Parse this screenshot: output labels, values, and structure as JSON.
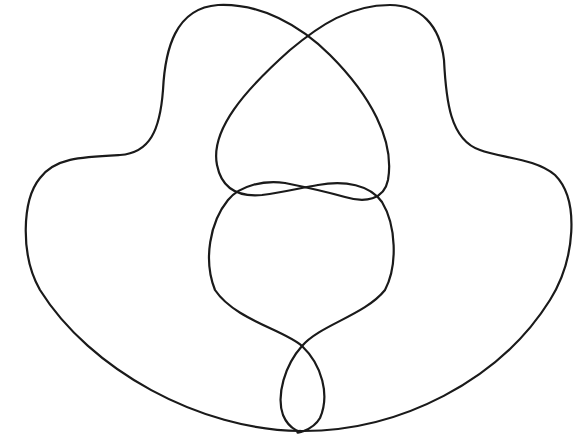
{
  "diagram": {
    "type": "closed-curve-line-drawing",
    "stroke_color": "#1a1a1a",
    "background": "#ffffff",
    "crossings": [
      {
        "name": "top",
        "x": 304,
        "y": 42
      },
      {
        "name": "middle-left",
        "x": 232,
        "y": 197
      },
      {
        "name": "middle-center",
        "x": 303,
        "y": 188
      },
      {
        "name": "middle-right",
        "x": 376,
        "y": 198
      },
      {
        "name": "lower",
        "x": 302,
        "y": 346
      },
      {
        "name": "bottom",
        "x": 300,
        "y": 431
      }
    ]
  }
}
